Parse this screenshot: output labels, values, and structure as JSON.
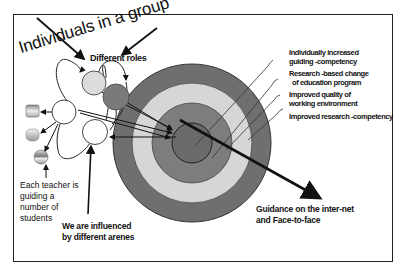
{
  "diagram": {
    "title": "Individuals in a group",
    "roles_label": "Different roles",
    "target_labels": [
      {
        "line1": "Individually increased",
        "line2": "guiding -competency"
      },
      {
        "line1": "Research -based change",
        "line2": "of education program"
      },
      {
        "line1": "Improved quality of",
        "line2": "working environment"
      },
      {
        "line1": "Improved research  -competency",
        "line2": ""
      }
    ],
    "teacher_note": {
      "line1": "Each teacher is",
      "line2": "guiding a",
      "line3": "number of",
      "line4": "students"
    },
    "arenas_note": {
      "line1": "We are influenced",
      "line2": "by different arenes"
    },
    "guidance_note": {
      "line1": "Guidance on the inter-net",
      "line2": "and Face-to-face"
    },
    "target": {
      "center": [
        192,
        143
      ],
      "rings": [
        {
          "radius": 79,
          "color": "#6f6f6f"
        },
        {
          "radius": 60,
          "color": "#d6d6d6"
        },
        {
          "radius": 40,
          "color": "#7d7d7d"
        },
        {
          "radius": 20,
          "color": "#6a6a6a"
        }
      ]
    },
    "colors": {
      "line": "#111111",
      "node_fill": "#ffffff",
      "node_light": "#dcdcdc",
      "node_dark": "#7a7a7a"
    }
  }
}
